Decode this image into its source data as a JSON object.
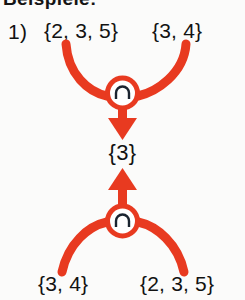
{
  "heading": "Beispiele:",
  "example": {
    "index_label": "1)",
    "top_row": {
      "left_set": "{2, 3, 5}",
      "right_set": "{3, 4}"
    },
    "result_set": "{3}",
    "bottom_row": {
      "left_set": "{3, 4}",
      "right_set": "{2, 3, 5}"
    }
  },
  "operators": {
    "top_node": {
      "symbol": "∩",
      "name": "intersection-operator"
    },
    "bottom_node": {
      "symbol": "∩",
      "name": "intersection-operator"
    }
  },
  "arrows": {
    "top_arrow_direction": "down",
    "bottom_arrow_direction": "up"
  },
  "colors": {
    "accent_red": "#E83A20",
    "ink": "#121212",
    "paper": "#FBFBFA",
    "node_fill": "#FFFFFF",
    "symbol_ink": "#1B2430"
  }
}
